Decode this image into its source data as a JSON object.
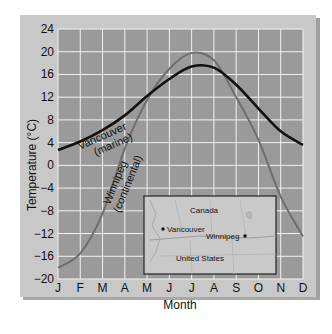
{
  "chart_data": {
    "type": "line",
    "title": "",
    "xlabel": "Month",
    "ylabel": "Temperature (°C)",
    "categories": [
      "J",
      "F",
      "M",
      "A",
      "M",
      "J",
      "J",
      "A",
      "S",
      "O",
      "N",
      "D"
    ],
    "yticks": [
      24,
      20,
      16,
      12,
      8,
      4,
      0,
      -4,
      -8,
      -12,
      -16,
      -20
    ],
    "ylim": [
      -20,
      24
    ],
    "grid": true,
    "series": [
      {
        "name": "Vancouver (marine)",
        "color": "#111111",
        "values": [
          2.7,
          4.2,
          6.2,
          8.8,
          12.2,
          15.2,
          17.4,
          17.2,
          14.2,
          10.0,
          6.0,
          3.6
        ]
      },
      {
        "name": "Winnipeg (continental)",
        "color": "#6e6e6e",
        "values": [
          -18.0,
          -15.5,
          -8.5,
          3.0,
          11.5,
          17.0,
          19.8,
          18.5,
          12.0,
          4.5,
          -5.5,
          -12.5
        ]
      }
    ],
    "annotations": [
      {
        "text": "Vancouver",
        "sub": "(marine)"
      },
      {
        "text": "Winnipeg",
        "sub": "(continental)"
      }
    ],
    "inset_map": {
      "labels": [
        "Canada",
        "Vancouver",
        "Winnipeg",
        "United States"
      ]
    }
  },
  "labels": {
    "ylabel": "Temperature (°C)",
    "xlabel": "Month",
    "vancouver": "Vancouver",
    "vancouver_sub": "(marine)",
    "winnipeg": "Winnipeg",
    "winnipeg_sub": "(continental)",
    "map_canada": "Canada",
    "map_vancouver": "Vancouver",
    "map_winnipeg": "Winnipeg",
    "map_us": "United States"
  },
  "colors": {
    "plot_bg": "#9a9a9a",
    "grid": "#f2f2f2",
    "frame": "#c8c8c8",
    "map_bg": "#c9c9c9"
  }
}
